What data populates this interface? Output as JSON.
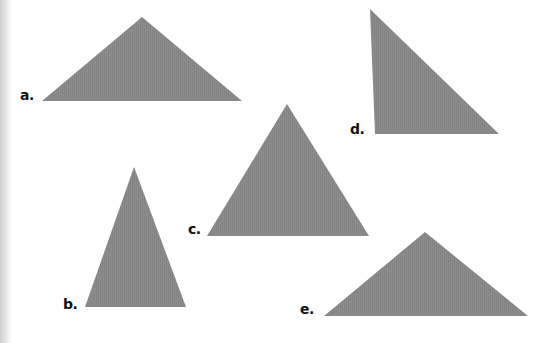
{
  "figure": {
    "fill_color": "#8a8a8a",
    "background_color": "#ffffff",
    "label_color": "#111111"
  },
  "triangles": [
    {
      "id": "a",
      "label": "a.",
      "points": "42,101 142,17 242,101",
      "label_pos": {
        "x": 20,
        "y": 88
      }
    },
    {
      "id": "b",
      "label": "b.",
      "points": "85,307 134,167 186,307",
      "label_pos": {
        "x": 63,
        "y": 297
      }
    },
    {
      "id": "c",
      "label": "c.",
      "points": "207,236 287,104 369,236",
      "label_pos": {
        "x": 188,
        "y": 222
      }
    },
    {
      "id": "d",
      "label": "d.",
      "points": "370,9 375,134 499,134",
      "label_pos": {
        "x": 350,
        "y": 122
      }
    },
    {
      "id": "e",
      "label": "e.",
      "points": "324,316 425,232 528,316",
      "label_pos": {
        "x": 300,
        "y": 302
      }
    }
  ]
}
